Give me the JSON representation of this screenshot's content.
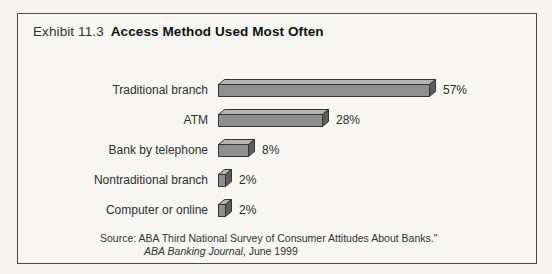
{
  "header": {
    "exhibit_label": "Exhibit 11.3",
    "title": "Access Method Used Most Often"
  },
  "chart_data": {
    "type": "bar",
    "orientation": "horizontal",
    "bar_style": "3d-extruded",
    "categories": [
      "Traditional branch",
      "ATM",
      "Bank by telephone",
      "Nontraditional branch",
      "Computer or online"
    ],
    "values": [
      57,
      28,
      8,
      2,
      2
    ],
    "value_labels": [
      "57%",
      "28%",
      "8%",
      "2%",
      "2%"
    ],
    "unit": "%",
    "xlim": [
      0,
      60
    ],
    "grid": false,
    "legend": false,
    "title": "Access Method Used Most Often"
  },
  "source": {
    "line1": "Source: ABA Third National Survey of Consumer Attitudes About Banks.\"",
    "journal": "ABA Banking Journal",
    "date": ", June 1999"
  },
  "colors": {
    "background": "#f5f4f1",
    "panel_background": "#f7f6f2",
    "panel_border": "#4b4b4b",
    "bar_front": "#8f8f8f",
    "bar_top": "#b6b4b0",
    "bar_side": "#5e5e5e",
    "bar_outline": "#333333",
    "text": "#2b2b2b"
  }
}
